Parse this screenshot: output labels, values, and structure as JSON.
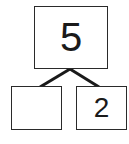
{
  "number_bond": {
    "whole": "5",
    "parts": [
      "",
      "2"
    ]
  },
  "colors": {
    "stroke": "#1a1a1a",
    "background": "#ffffff"
  }
}
